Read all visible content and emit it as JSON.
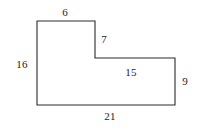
{
  "figure": {
    "kind": "geometry-diagram",
    "shape_name": "l-shaped-polygon",
    "background_color": "#ffffff",
    "stroke_color": "#2b2b2b",
    "stroke_width": 1.1,
    "label_color": "#1b1b1b",
    "viewbox": {
      "width": 199,
      "height": 130
    },
    "vertices": [
      {
        "name": "top-left",
        "x": 37,
        "y": 21
      },
      {
        "name": "top-right-upper",
        "x": 95,
        "y": 21
      },
      {
        "name": "step-inner-top",
        "x": 95,
        "y": 58
      },
      {
        "name": "step-inner-right",
        "x": 175,
        "y": 58
      },
      {
        "name": "bottom-right",
        "x": 175,
        "y": 105
      },
      {
        "name": "bottom-left",
        "x": 37,
        "y": 105
      }
    ],
    "polygon_points": "37,21 95,21 95,58 175,58 175,105 37,105",
    "labels": [
      {
        "id": "top",
        "text": "6",
        "edge": "top-upper-horizontal",
        "x": 65,
        "y": 12
      },
      {
        "id": "step-vertical",
        "text": "7",
        "edge": "upper-right-vertical",
        "x": 104,
        "y": 39
      },
      {
        "id": "left",
        "text": "16",
        "edge": "left-vertical",
        "x": 22,
        "y": 64
      },
      {
        "id": "ledge",
        "text": "15",
        "edge": "inner-horizontal-ledge",
        "x": 131,
        "y": 72
      },
      {
        "id": "right",
        "text": "9",
        "edge": "right-vertical",
        "x": 185,
        "y": 81
      },
      {
        "id": "bottom",
        "text": "21",
        "edge": "bottom-horizontal",
        "x": 110,
        "y": 116
      }
    ]
  }
}
